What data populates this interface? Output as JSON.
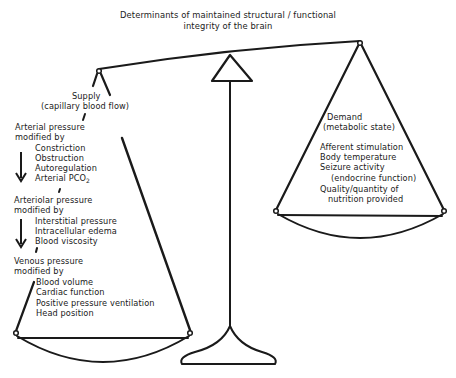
{
  "title": {
    "line1": "Determinants of maintained structural / functional",
    "line2": "integrity of the brain"
  },
  "supply": {
    "heading": "Supply",
    "subheading": "(capillary blood flow)",
    "arterial": {
      "heading1": "Arterial pressure",
      "heading2": "modified by",
      "items": [
        "Constriction",
        "Obstruction",
        "Autoregulation",
        "Arterial PCO"
      ],
      "pco_subscript": "2"
    },
    "arteriolar": {
      "heading1": "Arteriolar pressure",
      "heading2": "modified by",
      "items": [
        "Interstitial pressure",
        "Intracellular edema",
        "Blood viscosity"
      ]
    },
    "venous": {
      "heading1": "Venous pressure",
      "heading2": "modified by",
      "items": [
        "Blood volume",
        "Cardiac function",
        "Positive pressure ventilation",
        "Head position"
      ]
    }
  },
  "demand": {
    "heading": "Demand",
    "subheading": "(metabolic state)",
    "items": [
      "Afferent stimulation",
      "Body temperature",
      "Seizure activity",
      "(endocrine function)",
      "Quality/quantity of",
      "nutrition provided"
    ]
  },
  "colors": {
    "ink": "#1a1a1a",
    "background": "#ffffff"
  }
}
